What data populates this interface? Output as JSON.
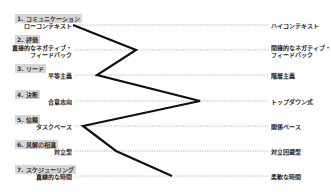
{
  "diagram": {
    "type": "culture-map-profile",
    "scales": [
      {
        "category": "1. コミュニケーション",
        "left": "ローコンテキスト",
        "right": "ハイコンテキスト",
        "y": 25,
        "point_x": 73
      },
      {
        "category": "2. 評価",
        "left": "直接的なネガティブ・\nフィードバック",
        "right": "間接的なネガティブ・\nフィードバック",
        "y": 50,
        "point_x": 136
      },
      {
        "category": "3. リード",
        "left": "平等主義",
        "right": "階層主義",
        "y": 75,
        "point_x": 97
      },
      {
        "category": "4. 決断",
        "left": "合意志向",
        "right": "トップダウン式",
        "y": 101,
        "point_x": 200
      },
      {
        "category": "5. 信頼",
        "left": "タスクベース",
        "right": "関係ベース",
        "y": 126,
        "point_x": 83
      },
      {
        "category": "6. 見解の相違",
        "left": "対立型",
        "right": "対立回避型",
        "y": 151,
        "point_x": 116
      },
      {
        "category": "7. スケジューリング",
        "left": "直線的な時間",
        "right": "柔軟な時間",
        "y": 176,
        "point_x": 172
      }
    ],
    "colors": {
      "line": "#111111",
      "dotted": "#888888",
      "category_bg": "#d6d6d6"
    }
  }
}
